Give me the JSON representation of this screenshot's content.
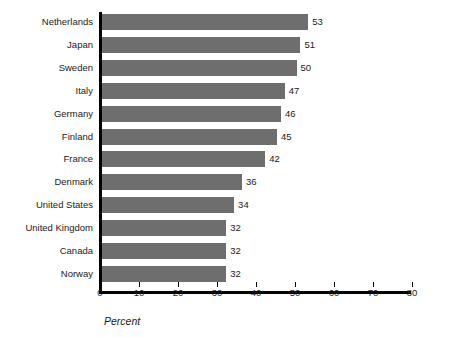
{
  "chart_data": {
    "type": "bar",
    "orientation": "horizontal",
    "title": "",
    "xlabel": "Percent",
    "ylabel": "",
    "xlim": [
      0,
      80
    ],
    "xticks": [
      0,
      10,
      20,
      30,
      40,
      50,
      60,
      70,
      80
    ],
    "grid": false,
    "legend": null,
    "bar_color": "#6e6e6e",
    "axis_color": "#000000",
    "categories": [
      "Netherlands",
      "Japan",
      "Sweden",
      "Italy",
      "Germany",
      "Finland",
      "France",
      "Denmark",
      "United States",
      "United Kingdom",
      "Canada",
      "Norway"
    ],
    "values": [
      53,
      51,
      50,
      47,
      46,
      45,
      42,
      36,
      34,
      32,
      32,
      32
    ],
    "value_labels": [
      "53",
      "51",
      "50",
      "47",
      "46",
      "45",
      "42",
      "36",
      "34",
      "32",
      "32",
      "32"
    ],
    "tick_labels": [
      "0",
      "10",
      "20",
      "30",
      "40",
      "50",
      "60",
      "70",
      "80"
    ]
  }
}
